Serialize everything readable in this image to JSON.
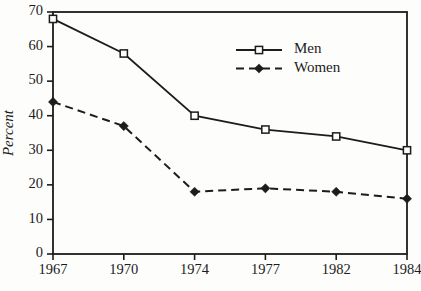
{
  "figure": {
    "background": "#fdfdfb",
    "ink_color": "#1c1c1c",
    "width": 421,
    "height": 291
  },
  "chart_data": {
    "type": "line",
    "categories": [
      "1967",
      "1970",
      "1974",
      "1977",
      "1982",
      "1984"
    ],
    "series": [
      {
        "name": "Men",
        "values": [
          68,
          58,
          40,
          36,
          34,
          30
        ],
        "line_style": "solid",
        "marker": "open-square",
        "color": "#1c1c1c"
      },
      {
        "name": "Women",
        "values": [
          44,
          37,
          18,
          19,
          18,
          16
        ],
        "line_style": "dashed",
        "marker": "filled-diamond",
        "color": "#1c1c1c"
      }
    ],
    "title": "",
    "xlabel": "",
    "ylabel": "Percent",
    "ylim": [
      0,
      70
    ],
    "yticks": [
      0,
      10,
      20,
      30,
      40,
      50,
      60,
      70
    ],
    "grid": false,
    "frame": "full-box",
    "legend_position": "inside upper-center-right",
    "layout_note": "categories equally spaced along x-axis despite unequal year intervals"
  }
}
